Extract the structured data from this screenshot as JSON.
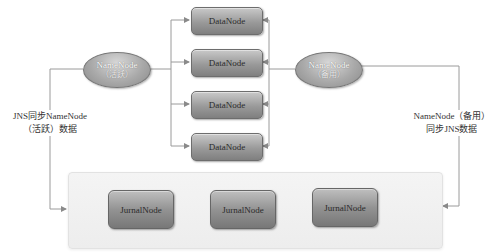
{
  "diagram": {
    "namenode_active": {
      "name": "NameNode",
      "role": "（活跃）"
    },
    "namenode_standby": {
      "name": "NameNode",
      "role": "（备用）"
    },
    "datanodes": [
      {
        "label": "DataNode"
      },
      {
        "label": "DataNode"
      },
      {
        "label": "DataNode"
      },
      {
        "label": "DataNode"
      }
    ],
    "jns_cluster": {
      "journalnodes": [
        {
          "label": "JurnalNode"
        },
        {
          "label": "JurnalNode"
        },
        {
          "label": "JurnalNode"
        }
      ]
    },
    "left_edge_label": {
      "line1": "JNS同步NameNode",
      "line2": "（活跃）数据"
    },
    "right_edge_label": {
      "line1": "NameNode（备用）",
      "line2": "同步JNS数据"
    },
    "colors": {
      "node_fill": "#9a9a9a",
      "line": "#8a8a8a",
      "container": "#efefef"
    }
  }
}
